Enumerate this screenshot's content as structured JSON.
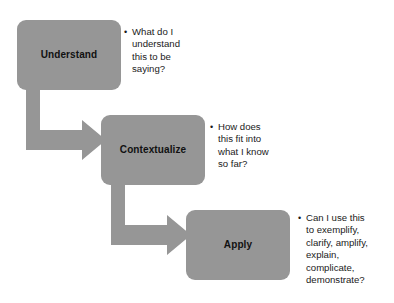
{
  "diagram": {
    "background_color": "#ffffff",
    "shape_fill_color": "#969696",
    "label_text_color": "#111111",
    "note_text_color": "#1a1a1a",
    "steps": [
      {
        "id": "understand",
        "label": "Understand",
        "note_lines": [
          "What do I",
          "understand",
          "this to be",
          "saying?"
        ],
        "note_text": "What do I understand this to be saying?"
      },
      {
        "id": "contextualize",
        "label": "Contextualize",
        "note_lines": [
          "How does",
          "this fit into",
          "what I know",
          "so far?"
        ],
        "note_text": "How does this fit into what I know so far?"
      },
      {
        "id": "apply",
        "label": "Apply",
        "note_lines": [
          "Can I use this",
          "to exemplify,",
          "clarify, amplify,",
          "explain,",
          "complicate,",
          "demonstrate?"
        ],
        "note_text": "Can I use this to exemplify, clarify, amplify, explain, complicate, demonstrate?"
      }
    ],
    "connectors": [
      {
        "id": "understand-to-contextualize",
        "from": "understand",
        "to": "contextualize",
        "shape": "elbow-down-right-arrow",
        "icon": "block-arrow-icon"
      },
      {
        "id": "contextualize-to-apply",
        "from": "contextualize",
        "to": "apply",
        "shape": "elbow-down-right-arrow",
        "icon": "block-arrow-icon"
      }
    ]
  }
}
